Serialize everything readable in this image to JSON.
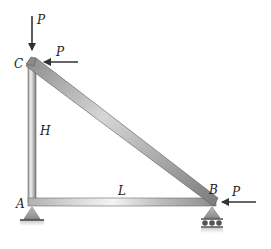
{
  "diagram": {
    "type": "truss",
    "nodes": {
      "A": {
        "label": "A"
      },
      "B": {
        "label": "B"
      },
      "C": {
        "label": "C"
      }
    },
    "dimensions": {
      "height_label": "H",
      "length_label": "L"
    },
    "loads": [
      {
        "id": "load-c-vertical",
        "label": "P",
        "at": "C",
        "direction": "down"
      },
      {
        "id": "load-c-horizontal",
        "label": "P",
        "at": "C",
        "direction": "left"
      },
      {
        "id": "load-b-horizontal",
        "label": "P",
        "at": "B",
        "direction": "left"
      }
    ],
    "supports": [
      {
        "at": "A",
        "type": "pin"
      },
      {
        "at": "B",
        "type": "roller"
      }
    ],
    "colors": {
      "member_light": "#e8e8e8",
      "member_dark": "#8a8a8a",
      "arrow": "#333333",
      "support": "#9a9a9a"
    }
  }
}
